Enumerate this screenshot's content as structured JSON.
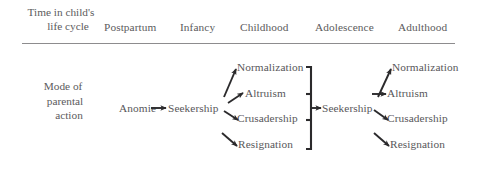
{
  "figure": {
    "type": "flow-table",
    "columns_header_label": "Time in child's life cycle",
    "row_header_label": "Mode of parental action",
    "header": {
      "stub_line1": "Time in child's",
      "stub_line2": "life cycle",
      "columns": [
        {
          "label": "Postpartum"
        },
        {
          "label": "Infancy"
        },
        {
          "label": "Childhood"
        },
        {
          "label": "Adolescence"
        },
        {
          "label": "Adulthood"
        }
      ]
    },
    "row": {
      "stub_line1": "Mode of",
      "stub_line2": "parental",
      "stub_line3": "action"
    },
    "nodes": {
      "postpartum": {
        "label": "Anomie"
      },
      "infancy": {
        "label": "Seekership"
      },
      "childhood": [
        {
          "label": "Normalization"
        },
        {
          "label": "Altruism"
        },
        {
          "label": "Crusadership"
        },
        {
          "label": "Resignation"
        }
      ],
      "adolescence": {
        "label": "Seekership"
      },
      "adulthood": [
        {
          "label": "Normalization"
        },
        {
          "label": "Altruism"
        },
        {
          "label": "Crusadership"
        },
        {
          "label": "Resignation"
        }
      ]
    },
    "connectors": {
      "anomie_to_seekership": "arrow-right",
      "seekership_to_childhood_fan": "arrow-fan-out",
      "childhood_brace_to_seekership": "brace-arrow-right",
      "seekership_to_adulthood_fan": "arrow-fan-out"
    },
    "colors": {
      "text": "#58575a",
      "rule": "#8d8c8e",
      "arrow": "#2b2a2c",
      "background": "#ffffff"
    }
  }
}
